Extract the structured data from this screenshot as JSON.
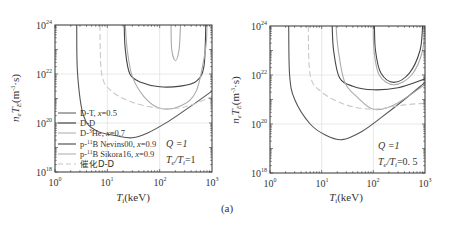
{
  "caption": "(a)",
  "chart_data": [
    {
      "type": "line",
      "panel": "left",
      "xlabel": "T_i(keV)",
      "ylabel": "n_e T_E(m^-3·s)",
      "xscale": "log",
      "yscale": "log",
      "xlim": [
        1,
        1000
      ],
      "ylim": [
        1e+18,
        1e+24
      ],
      "xticks": [
        "10^0",
        "10^1",
        "10^2",
        "10^3"
      ],
      "yticks": [
        "10^18",
        "10^20",
        "10^22",
        "10^24"
      ],
      "grid": true,
      "legend_position": "lower left",
      "annotations": [
        "Q=1",
        "T_e/T_i=1"
      ],
      "series": [
        {
          "name": "D-T, x=0.5",
          "color": "#555555",
          "dash": false,
          "points": [
            [
              2.6,
              1e+24
            ],
            [
              2.7,
              1e+22
            ],
            [
              3.5,
              2e+20
            ],
            [
              6,
              5e+19
            ],
            [
              15,
              3e+19
            ],
            [
              30,
              2.5e+19
            ],
            [
              60,
              4e+19
            ],
            [
              150,
              1.2e+20
            ],
            [
              400,
              5e+20
            ],
            [
              1000,
              2e+21
            ]
          ]
        },
        {
          "name": "D-D",
          "color": "#444444",
          "dash": false,
          "points": [
            [
              21,
              1e+24
            ],
            [
              22,
              1e+23
            ],
            [
              27,
              1e+22
            ],
            [
              45,
              4.5e+21
            ],
            [
              100,
              3e+21
            ],
            [
              250,
              3.2e+21
            ],
            [
              500,
              5e+21
            ],
            [
              700,
              2e+22
            ],
            [
              760,
              1e+24
            ]
          ]
        },
        {
          "name": "D-3He, x=0.7",
          "color": "#aaaaaa",
          "dash": false,
          "points": [
            [
              22,
              1e+24
            ],
            [
              24,
              1e+23
            ],
            [
              30,
              8e+21
            ],
            [
              50,
              1.2e+21
            ],
            [
              100,
              4e+20
            ],
            [
              250,
              5e+20
            ],
            [
              500,
              2e+21
            ],
            [
              750,
              1e+23
            ],
            [
              800,
              1e+24
            ]
          ]
        },
        {
          "name": "p-11B Nevins00, x=0.9",
          "color": "#555555",
          "dash": false,
          "points": []
        },
        {
          "name": "p-11B Sikora16, x=0.9",
          "color": "#aaaaaa",
          "dash": false,
          "points": [
            [
              165,
              1e+24
            ],
            [
              170,
              1e+23
            ],
            [
              200,
              3.5e+22
            ],
            [
              235,
              1e+23
            ],
            [
              250,
              1e+24
            ]
          ]
        },
        {
          "name": "催化D-D",
          "color": "#c8c8c8",
          "dash": true,
          "points": [
            [
              7.2,
              1e+24
            ],
            [
              7.8,
              1e+22
            ],
            [
              12,
              2e+21
            ],
            [
              30,
              7e+20
            ],
            [
              100,
              4e+20
            ],
            [
              300,
              4.5e+20
            ],
            [
              1000,
              1.2e+21
            ]
          ]
        }
      ]
    },
    {
      "type": "line",
      "panel": "right",
      "xlabel": "T_i(keV)",
      "ylabel": "n_e T_E(m^-3·s)",
      "xscale": "log",
      "yscale": "log",
      "xlim": [
        1,
        1000
      ],
      "ylim": [
        1e+18,
        1e+24
      ],
      "xticks": [
        "10^0",
        "10^1",
        "10^2",
        "10^3"
      ],
      "yticks": [
        "10^18",
        "10^20",
        "10^22",
        "10^24"
      ],
      "grid": true,
      "annotations": [
        "Q=1",
        "T_e/T_i=0.5"
      ],
      "series": [
        {
          "name": "D-T, x=0.5",
          "color": "#555555",
          "dash": false,
          "points": [
            [
              2.3,
              1e+24
            ],
            [
              2.4,
              1e+22
            ],
            [
              3,
              1e+21
            ],
            [
              6,
              1e+20
            ],
            [
              12,
              3.5e+19
            ],
            [
              25,
              2.3e+19
            ],
            [
              60,
              5e+19
            ],
            [
              150,
              2e+20
            ],
            [
              400,
              1e+21
            ],
            [
              1000,
              5e+21
            ]
          ]
        },
        {
          "name": "D-D",
          "color": "#444444",
          "dash": false,
          "points": [
            [
              16,
              1e+24
            ],
            [
              17,
              1e+23
            ],
            [
              22,
              8e+21
            ],
            [
              40,
              3.5e+21
            ],
            [
              100,
              2.5e+21
            ],
            [
              300,
              3e+21
            ],
            [
              1000,
              7e+21
            ]
          ]
        },
        {
          "name": "D-3He, x=0.7",
          "color": "#aaaaaa",
          "dash": false,
          "points": [
            [
              19,
              1e+24
            ],
            [
              21,
              1e+23
            ],
            [
              28,
              5e+21
            ],
            [
              50,
              1.2e+21
            ],
            [
              100,
              4e+20
            ],
            [
              250,
              6e+20
            ],
            [
              1000,
              4e+21
            ]
          ]
        },
        {
          "name": "p-11B Nevins00, x=0.9",
          "color": "#444444",
          "dash": false,
          "points": [
            [
              105,
              1e+24
            ],
            [
              110,
              1e+23
            ],
            [
              140,
              1.2e+22
            ],
            [
              250,
              5e+21
            ],
            [
              500,
              1.2e+22
            ],
            [
              800,
              1e+23
            ],
            [
              900,
              1e+24
            ]
          ]
        },
        {
          "name": "p-11B Sikora16, x=0.9",
          "color": "#aaaaaa",
          "dash": false,
          "points": [
            [
              100,
              1e+24
            ],
            [
              103,
              1e+23
            ],
            [
              130,
              1e+22
            ],
            [
              250,
              4e+21
            ],
            [
              550,
              1e+22
            ],
            [
              900,
              1e+23
            ],
            [
              960,
              1e+24
            ]
          ]
        },
        {
          "name": "催化D-D",
          "color": "#c8c8c8",
          "dash": true,
          "points": [
            [
              5.5,
              1e+24
            ],
            [
              6,
              1e+22
            ],
            [
              10,
              2e+21
            ],
            [
              30,
              6e+20
            ],
            [
              100,
              4e+20
            ],
            [
              400,
              6e+20
            ],
            [
              1000,
              7e+20
            ]
          ]
        }
      ]
    }
  ],
  "left": {
    "xticks": [
      "10",
      "10",
      "10",
      "10"
    ],
    "xtick_exp": [
      "0",
      "1",
      "2",
      "3"
    ],
    "yticks": [
      "10",
      "10",
      "10",
      "10"
    ],
    "ytick_exp": [
      "18",
      "20",
      "22",
      "24"
    ],
    "xlabel_T": "T",
    "xlabel_sub": "i",
    "xlabel_unit": "(keV)",
    "ylabel_n": "n",
    "ylabel_e": "e",
    "ylabel_T": "T",
    "ylabel_E": "E",
    "ylabel_unit_pre": "(m",
    "ylabel_unit_exp": "-3",
    "ylabel_unit_post": "·s)",
    "annot_q": "Q =1",
    "annot_ratio_T": "T",
    "annot_ratio_e": "e",
    "annot_ratio_mid": "/T",
    "annot_ratio_i": "i",
    "annot_ratio_val": "=1",
    "legend": [
      {
        "label_pre": "D-T, ",
        "label_var": "x",
        "label_post": "=0.5",
        "sup": ""
      },
      {
        "label_pre": "D-D",
        "label_var": "",
        "label_post": "",
        "sup": ""
      },
      {
        "label_pre": "D-",
        "sup": "3",
        "label_mid": "He, ",
        "label_var": "x",
        "label_post": "=0.7"
      },
      {
        "label_pre": "p-",
        "sup": "11",
        "label_mid": "B Nevins00, ",
        "label_var": "x",
        "label_post": "=0.9"
      },
      {
        "label_pre": "p-",
        "sup": "11",
        "label_mid": "B Sikora16, ",
        "label_var": "x",
        "label_post": "=0.9"
      },
      {
        "label_pre": "催化D-D",
        "label_var": "",
        "label_post": "",
        "sup": ""
      }
    ]
  },
  "right": {
    "annot_q": "Q =1",
    "annot_ratio_val": "=0. 5"
  }
}
